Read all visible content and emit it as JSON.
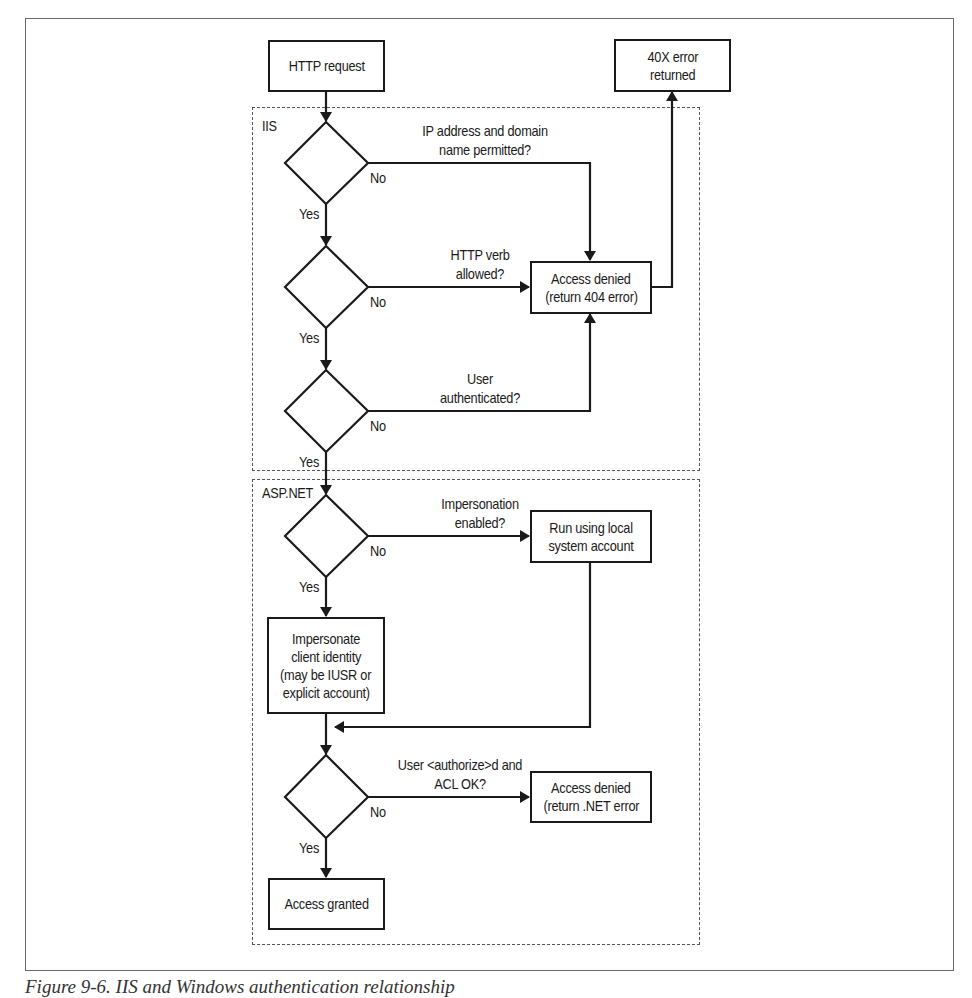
{
  "figure": {
    "caption": "Figure 9-6. IIS and Windows authentication relationship"
  },
  "groups": {
    "iis": {
      "label": "IIS"
    },
    "aspnet": {
      "label": "ASP.NET"
    }
  },
  "nodes": {
    "http_request": {
      "lines": [
        "HTTP request"
      ]
    },
    "error_40x": {
      "lines": [
        "40X error",
        "returned"
      ]
    },
    "access_denied_404": {
      "lines": [
        "Access denied",
        "(return 404 error)"
      ]
    },
    "run_local": {
      "lines": [
        "Run using local",
        "system account"
      ]
    },
    "impersonate": {
      "lines": [
        "Impersonate",
        "client identity",
        "(may be IUSR or",
        "explicit account)"
      ]
    },
    "access_denied_net": {
      "lines": [
        "Access denied",
        "(return .NET error"
      ]
    },
    "access_granted": {
      "lines": [
        "Access granted"
      ]
    }
  },
  "decisions": [
    {
      "id": "ip_domain",
      "question": [
        "IP address and domain",
        "name permitted?"
      ],
      "yes_label": "Yes",
      "no_label": "No"
    },
    {
      "id": "http_verb",
      "question": [
        "HTTP verb",
        "allowed?"
      ],
      "yes_label": "Yes",
      "no_label": "No"
    },
    {
      "id": "user_auth",
      "question": [
        "User",
        "authenticated?"
      ],
      "yes_label": "Yes",
      "no_label": "No"
    },
    {
      "id": "impersonation",
      "question": [
        "Impersonation",
        "enabled?"
      ],
      "yes_label": "Yes",
      "no_label": "No"
    },
    {
      "id": "authorize_acl",
      "question": [
        "User <authorize>d and",
        "ACL OK?"
      ],
      "yes_label": "Yes",
      "no_label": "No"
    }
  ],
  "colors": {
    "stroke": "#1a1a1a",
    "frame": "#6a6a6a",
    "dashed": "#555555",
    "background": "#ffffff"
  }
}
